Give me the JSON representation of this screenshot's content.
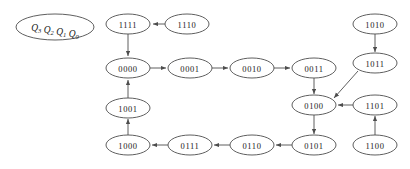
{
  "diagram": {
    "background_color": "#ffffff",
    "stroke_color": "#4d4d4d",
    "text_color": "#1a1a1a",
    "legend": {
      "name": "state-variable-legend",
      "parts": [
        {
          "base": "Q",
          "sub": "3"
        },
        {
          "base": "Q",
          "sub": "2"
        },
        {
          "base": "Q",
          "sub": "1"
        },
        {
          "base": "Q",
          "sub": "0"
        }
      ],
      "cx": 55,
      "cy": 27,
      "rx": 39,
      "ry": 13
    },
    "nodes": [
      {
        "id": "1111",
        "label": "1111",
        "cx": 128,
        "cy": 24,
        "rx": 22,
        "ry": 10
      },
      {
        "id": "1110",
        "label": "1110",
        "cx": 187,
        "cy": 24,
        "rx": 22,
        "ry": 10
      },
      {
        "id": "1010",
        "label": "1010",
        "cx": 375,
        "cy": 24,
        "rx": 22,
        "ry": 10
      },
      {
        "id": "0000",
        "label": "0000",
        "cx": 128,
        "cy": 68,
        "rx": 22,
        "ry": 10
      },
      {
        "id": "0001",
        "label": "0001",
        "cx": 190,
        "cy": 68,
        "rx": 22,
        "ry": 10
      },
      {
        "id": "0010",
        "label": "0010",
        "cx": 252,
        "cy": 68,
        "rx": 22,
        "ry": 10
      },
      {
        "id": "0011",
        "label": "0011",
        "cx": 314,
        "cy": 68,
        "rx": 22,
        "ry": 10
      },
      {
        "id": "1011",
        "label": "1011",
        "cx": 375,
        "cy": 63,
        "rx": 22,
        "ry": 10
      },
      {
        "id": "1001",
        "label": "1001",
        "cx": 128,
        "cy": 108,
        "rx": 22,
        "ry": 10
      },
      {
        "id": "0100",
        "label": "0100",
        "cx": 314,
        "cy": 105,
        "rx": 22,
        "ry": 10
      },
      {
        "id": "1101",
        "label": "1101",
        "cx": 375,
        "cy": 105,
        "rx": 22,
        "ry": 10
      },
      {
        "id": "1000",
        "label": "1000",
        "cx": 128,
        "cy": 145,
        "rx": 22,
        "ry": 10
      },
      {
        "id": "0111",
        "label": "0111",
        "cx": 190,
        "cy": 145,
        "rx": 22,
        "ry": 10
      },
      {
        "id": "0110",
        "label": "0110",
        "cx": 252,
        "cy": 145,
        "rx": 22,
        "ry": 10
      },
      {
        "id": "0101",
        "label": "0101",
        "cx": 314,
        "cy": 145,
        "rx": 22,
        "ry": 10
      },
      {
        "id": "1100",
        "label": "1100",
        "cx": 375,
        "cy": 145,
        "rx": 22,
        "ry": 10
      }
    ],
    "edges": [
      {
        "from": "1110",
        "to": "1111",
        "x1": 165,
        "y1": 24,
        "x2": 153,
        "y2": 24
      },
      {
        "from": "1111",
        "to": "0000",
        "x1": 128,
        "y1": 34,
        "x2": 128,
        "y2": 56
      },
      {
        "from": "0000",
        "to": "0001",
        "x1": 150,
        "y1": 68,
        "x2": 166,
        "y2": 68
      },
      {
        "from": "0001",
        "to": "0010",
        "x1": 212,
        "y1": 68,
        "x2": 228,
        "y2": 68
      },
      {
        "from": "0010",
        "to": "0011",
        "x1": 274,
        "y1": 68,
        "x2": 290,
        "y2": 68
      },
      {
        "from": "0011",
        "to": "0100",
        "x1": 314,
        "y1": 78,
        "x2": 314,
        "y2": 94
      },
      {
        "from": "1010",
        "to": "1011",
        "x1": 375,
        "y1": 34,
        "x2": 375,
        "y2": 52
      },
      {
        "from": "1011",
        "to": "0100",
        "x1": 358,
        "y1": 71,
        "x2": 334,
        "y2": 98
      },
      {
        "from": "1101",
        "to": "0100",
        "x1": 353,
        "y1": 105,
        "x2": 338,
        "y2": 105
      },
      {
        "from": "1100",
        "to": "1101",
        "x1": 375,
        "y1": 135,
        "x2": 375,
        "y2": 116
      },
      {
        "from": "0100",
        "to": "0101",
        "x1": 314,
        "y1": 115,
        "x2": 314,
        "y2": 134
      },
      {
        "from": "0101",
        "to": "0110",
        "x1": 292,
        "y1": 145,
        "x2": 276,
        "y2": 145
      },
      {
        "from": "0110",
        "to": "0111",
        "x1": 230,
        "y1": 145,
        "x2": 214,
        "y2": 145
      },
      {
        "from": "0111",
        "to": "1000",
        "x1": 168,
        "y1": 145,
        "x2": 152,
        "y2": 145
      },
      {
        "from": "1000",
        "to": "1001",
        "x1": 128,
        "y1": 135,
        "x2": 128,
        "y2": 119
      },
      {
        "from": "1001",
        "to": "0000",
        "x1": 128,
        "y1": 98,
        "x2": 128,
        "y2": 80
      }
    ]
  }
}
